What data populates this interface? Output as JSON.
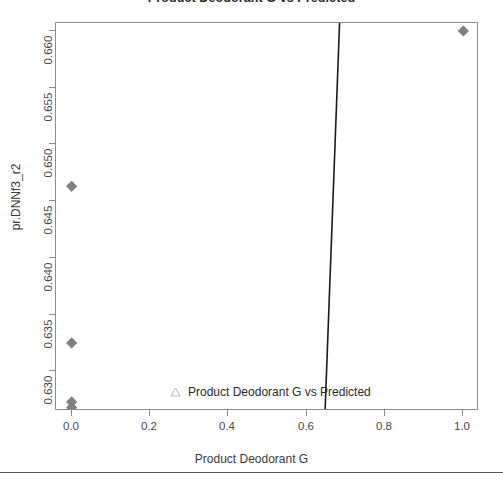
{
  "chart_data": {
    "type": "scatter",
    "title": "Product Deodorant G vs Predicted",
    "xlabel": "Product Deodorant G",
    "ylabel": "pr.DNNf3_r2",
    "xlim": [
      -0.04,
      1.04
    ],
    "ylim": [
      0.6265,
      0.6607
    ],
    "xticks": [
      "0.0",
      "0.2",
      "0.4",
      "0.6",
      "0.8",
      "1.0"
    ],
    "xtick_values": [
      0.0,
      0.2,
      0.4,
      0.6,
      0.8,
      1.0
    ],
    "yticks": [
      "0.630",
      "0.635",
      "0.640",
      "0.645",
      "0.650",
      "0.655",
      "0.660"
    ],
    "ytick_values": [
      0.63,
      0.635,
      0.64,
      0.645,
      0.65,
      0.655,
      0.66
    ],
    "grid": false,
    "legend_position": "bottom-center",
    "series": [
      {
        "name": "Product Deodorant G vs Predicted",
        "marker": "diamond",
        "color": "#808080",
        "points": [
          {
            "x": 1.0,
            "y": 0.66
          },
          {
            "x": 0.0,
            "y": 0.6463
          },
          {
            "x": 0.0,
            "y": 0.6325
          },
          {
            "x": 0.0,
            "y": 0.6273
          },
          {
            "x": 0.0,
            "y": 0.6268
          }
        ]
      }
    ],
    "fit_line": {
      "name": "fit-line",
      "color": "#1a1a1a",
      "x_at_ytop": 0.684,
      "x_at_ybottom": 0.647,
      "y_top": 0.6607,
      "y_bottom": 0.6265
    },
    "legend": {
      "marker": "open-triangle",
      "marker_color": "#b5b5b5",
      "label": "Product Deodorant G vs Predicted"
    },
    "colors": {
      "marker": "#808080",
      "line": "#1a1a1a",
      "axis": "#8d8d8d",
      "text": "#3a3a3a",
      "background": "#ffffff"
    }
  }
}
